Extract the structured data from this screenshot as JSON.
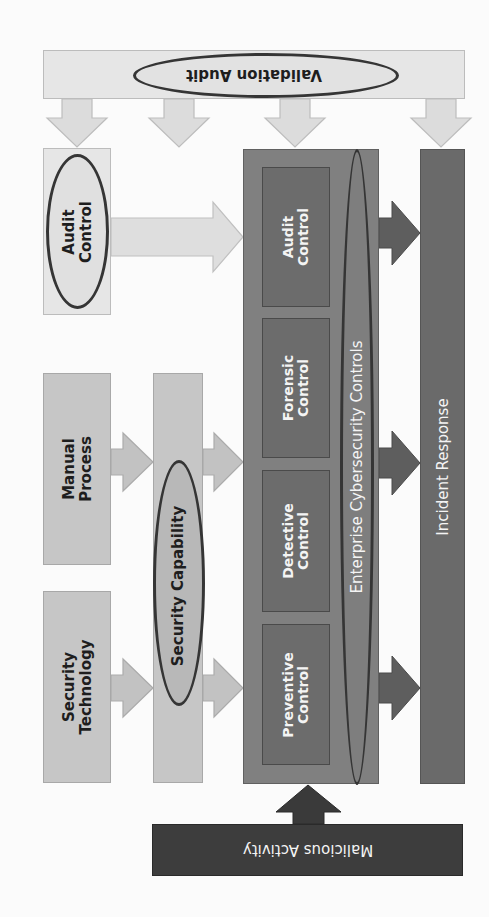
{
  "diagram": {
    "orientation": "rotated 90 degrees (text reads bottom-to-top)",
    "nodes": {
      "validation_audit": "Validation Audit",
      "audit_control_source": [
        "Audit",
        "Control"
      ],
      "manual_process": [
        "Manual",
        "Process"
      ],
      "security_technology": [
        "Security",
        "Technology"
      ],
      "security_capability": "Security Capability",
      "enterprise_controls": "Enterprise Cybersecurity Controls",
      "controls": [
        {
          "line1": "Audit",
          "line2": "Control"
        },
        {
          "line1": "Forensic",
          "line2": "Control"
        },
        {
          "line1": "Detective",
          "line2": "Control"
        },
        {
          "line1": "Preventive",
          "line2": "Control"
        }
      ],
      "incident_response": "Incident Response",
      "malicious_activity": "Malicious Activity"
    },
    "edges": [
      {
        "from": "Validation Audit",
        "to": "Audit Control"
      },
      {
        "from": "Validation Audit",
        "to": "Security Capability"
      },
      {
        "from": "Validation Audit",
        "to": "Enterprise Cybersecurity Controls"
      },
      {
        "from": "Validation Audit",
        "to": "Incident Response"
      },
      {
        "from": "Audit Control",
        "to": "Enterprise Cybersecurity Controls"
      },
      {
        "from": "Manual Process",
        "to": "Security Capability"
      },
      {
        "from": "Security Technology",
        "to": "Security Capability"
      },
      {
        "from": "Security Capability",
        "to": "Enterprise Cybersecurity Controls"
      },
      {
        "from": "Enterprise Cybersecurity Controls",
        "to": "Incident Response"
      },
      {
        "from": "Malicious Activity",
        "to": "Enterprise Cybersecurity Controls"
      }
    ],
    "colors": {
      "very_light": "#e6e6e6",
      "light": "#c6c6c6",
      "mid": "#808080",
      "inner": "#6c6c6c",
      "incident": "#6a6a6a",
      "dark": "#3d3d3d",
      "ellipse_border": "#353535"
    }
  }
}
